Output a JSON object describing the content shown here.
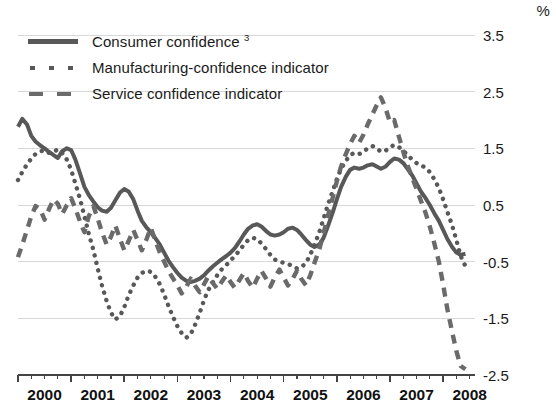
{
  "unit": "%",
  "legend": {
    "position": "top-left-inside",
    "items": [
      {
        "label": "Consumer confidence",
        "footnote": "3",
        "style": "solid",
        "key_name": "legend-key-solid"
      },
      {
        "label": "Manufacturing-confidence indicator",
        "footnote": "",
        "style": "dotted",
        "key_name": "legend-key-dotted"
      },
      {
        "label": "Service confidence indicator",
        "footnote": "",
        "style": "dashed",
        "key_name": "legend-key-dashed"
      }
    ]
  },
  "colors": {
    "consumer": "#585858",
    "manufacturing": "#585858",
    "service": "#6a6a6a",
    "gridline": "#d8d8d8",
    "axis": "#444444",
    "text": "#1a1a1a"
  },
  "chart_data": {
    "type": "line",
    "title": "",
    "subtitle": "",
    "xlabel": "",
    "ylabel": "%",
    "ylim": [
      -2.5,
      3.5
    ],
    "xlim": [
      2000.0,
      2008.6
    ],
    "yticks": [
      3.5,
      2.5,
      1.5,
      0.5,
      -0.5,
      -1.5,
      -2.5
    ],
    "ytick_labels": [
      "3.5",
      "2.5",
      "1.5",
      "0.5",
      "-0.5",
      "-1.5",
      "-2.5"
    ],
    "xticks": [
      2000,
      2001,
      2002,
      2003,
      2004,
      2005,
      2006,
      2007,
      2008
    ],
    "xtick_labels": [
      "2000",
      "2001",
      "2002",
      "2003",
      "2004",
      "2005",
      "2006",
      "2007",
      "2008"
    ],
    "minor_ticks_per_year": 4,
    "grid": true,
    "grid_axis": "y",
    "legend_position": "upper left",
    "series": [
      {
        "name": "Consumer confidence",
        "style": "solid",
        "color": "#585858",
        "x": [
          2000.0,
          2000.08,
          2000.17,
          2000.25,
          2000.33,
          2000.42,
          2000.5,
          2000.58,
          2000.67,
          2000.75,
          2000.83,
          2000.92,
          2001.0,
          2001.08,
          2001.17,
          2001.25,
          2001.33,
          2001.42,
          2001.5,
          2001.58,
          2001.67,
          2001.75,
          2001.83,
          2001.92,
          2002.0,
          2002.08,
          2002.17,
          2002.25,
          2002.33,
          2002.42,
          2002.5,
          2002.58,
          2002.67,
          2002.75,
          2002.83,
          2002.92,
          2003.0,
          2003.08,
          2003.17,
          2003.25,
          2003.33,
          2003.42,
          2003.5,
          2003.58,
          2003.67,
          2003.75,
          2003.83,
          2003.92,
          2004.0,
          2004.08,
          2004.17,
          2004.25,
          2004.33,
          2004.42,
          2004.5,
          2004.58,
          2004.67,
          2004.75,
          2004.83,
          2004.92,
          2005.0,
          2005.08,
          2005.17,
          2005.25,
          2005.33,
          2005.42,
          2005.5,
          2005.58,
          2005.67,
          2005.75,
          2005.83,
          2005.92,
          2006.0,
          2006.08,
          2006.17,
          2006.25,
          2006.33,
          2006.42,
          2006.5,
          2006.58,
          2006.67,
          2006.75,
          2006.83,
          2006.92,
          2007.0,
          2007.08,
          2007.17,
          2007.25,
          2007.33,
          2007.42,
          2007.5,
          2007.58,
          2007.67,
          2007.75,
          2007.83,
          2007.92,
          2008.0,
          2008.08,
          2008.17,
          2008.25,
          2008.33,
          2008.42
        ],
        "y": [
          1.88,
          2.02,
          1.92,
          1.72,
          1.62,
          1.55,
          1.5,
          1.44,
          1.38,
          1.33,
          1.45,
          1.5,
          1.47,
          1.3,
          1.05,
          0.82,
          0.68,
          0.56,
          0.46,
          0.4,
          0.38,
          0.45,
          0.58,
          0.72,
          0.78,
          0.74,
          0.6,
          0.4,
          0.22,
          0.1,
          0.02,
          -0.08,
          -0.2,
          -0.34,
          -0.48,
          -0.6,
          -0.7,
          -0.78,
          -0.84,
          -0.86,
          -0.84,
          -0.8,
          -0.74,
          -0.66,
          -0.58,
          -0.52,
          -0.46,
          -0.4,
          -0.34,
          -0.26,
          -0.14,
          -0.02,
          0.08,
          0.14,
          0.16,
          0.12,
          0.04,
          -0.02,
          -0.04,
          -0.02,
          0.02,
          0.08,
          0.1,
          0.06,
          -0.02,
          -0.12,
          -0.2,
          -0.24,
          -0.2,
          -0.08,
          0.12,
          0.36,
          0.6,
          0.82,
          1.0,
          1.12,
          1.16,
          1.14,
          1.16,
          1.2,
          1.22,
          1.18,
          1.14,
          1.18,
          1.26,
          1.32,
          1.3,
          1.24,
          1.14,
          1.02,
          0.88,
          0.74,
          0.62,
          0.5,
          0.36,
          0.22,
          0.06,
          -0.1,
          -0.24,
          -0.34,
          -0.38,
          -0.36
        ]
      },
      {
        "name": "Manufacturing-confidence indicator",
        "style": "dotted",
        "color": "#585858",
        "x": [
          2000.0,
          2000.08,
          2000.17,
          2000.25,
          2000.33,
          2000.42,
          2000.5,
          2000.58,
          2000.67,
          2000.75,
          2000.83,
          2000.92,
          2001.0,
          2001.08,
          2001.17,
          2001.25,
          2001.33,
          2001.42,
          2001.5,
          2001.58,
          2001.67,
          2001.75,
          2001.83,
          2001.92,
          2002.0,
          2002.08,
          2002.17,
          2002.25,
          2002.33,
          2002.42,
          2002.5,
          2002.58,
          2002.67,
          2002.75,
          2002.83,
          2002.92,
          2003.0,
          2003.08,
          2003.17,
          2003.25,
          2003.33,
          2003.42,
          2003.5,
          2003.58,
          2003.67,
          2003.75,
          2003.83,
          2003.92,
          2004.0,
          2004.08,
          2004.17,
          2004.25,
          2004.33,
          2004.42,
          2004.5,
          2004.58,
          2004.67,
          2004.75,
          2004.83,
          2004.92,
          2005.0,
          2005.08,
          2005.17,
          2005.25,
          2005.33,
          2005.42,
          2005.5,
          2005.58,
          2005.67,
          2005.75,
          2005.83,
          2005.92,
          2006.0,
          2006.08,
          2006.17,
          2006.25,
          2006.33,
          2006.42,
          2006.5,
          2006.58,
          2006.67,
          2006.75,
          2006.83,
          2006.92,
          2007.0,
          2007.08,
          2007.17,
          2007.25,
          2007.33,
          2007.42,
          2007.5,
          2007.58,
          2007.67,
          2007.75,
          2007.83,
          2007.92,
          2008.0,
          2008.08,
          2008.17,
          2008.25,
          2008.33,
          2008.42
        ],
        "y": [
          0.94,
          1.08,
          1.22,
          1.32,
          1.4,
          1.45,
          1.46,
          1.42,
          1.44,
          1.48,
          1.42,
          1.3,
          1.12,
          0.88,
          0.6,
          0.3,
          0.0,
          -0.3,
          -0.62,
          -0.92,
          -1.2,
          -1.4,
          -1.52,
          -1.46,
          -1.3,
          -1.1,
          -0.92,
          -0.78,
          -0.7,
          -0.66,
          -0.68,
          -0.76,
          -0.9,
          -1.08,
          -1.28,
          -1.48,
          -1.64,
          -1.76,
          -1.84,
          -1.78,
          -1.62,
          -1.4,
          -1.18,
          -1.0,
          -0.86,
          -0.74,
          -0.64,
          -0.56,
          -0.48,
          -0.4,
          -0.3,
          -0.2,
          -0.12,
          -0.08,
          -0.1,
          -0.18,
          -0.28,
          -0.38,
          -0.46,
          -0.5,
          -0.52,
          -0.54,
          -0.58,
          -0.62,
          -0.6,
          -0.52,
          -0.38,
          -0.2,
          0.02,
          0.26,
          0.5,
          0.74,
          0.96,
          1.14,
          1.28,
          1.38,
          1.42,
          1.4,
          1.44,
          1.5,
          1.54,
          1.5,
          1.44,
          1.46,
          1.52,
          1.56,
          1.52,
          1.46,
          1.38,
          1.3,
          1.24,
          1.2,
          1.16,
          1.08,
          0.96,
          0.8,
          0.6,
          0.38,
          0.14,
          -0.12,
          -0.4,
          -0.58
        ]
      },
      {
        "name": "Service confidence indicator",
        "style": "dashed",
        "color": "#6a6a6a",
        "x": [
          2000.0,
          2000.08,
          2000.17,
          2000.25,
          2000.33,
          2000.42,
          2000.5,
          2000.58,
          2000.67,
          2000.75,
          2000.83,
          2000.92,
          2001.0,
          2001.08,
          2001.17,
          2001.25,
          2001.33,
          2001.42,
          2001.5,
          2001.58,
          2001.67,
          2001.75,
          2001.83,
          2001.92,
          2002.0,
          2002.08,
          2002.17,
          2002.25,
          2002.33,
          2002.42,
          2002.5,
          2002.58,
          2002.67,
          2002.75,
          2002.83,
          2002.92,
          2003.0,
          2003.08,
          2003.17,
          2003.25,
          2003.33,
          2003.42,
          2003.5,
          2003.58,
          2003.67,
          2003.75,
          2003.83,
          2003.92,
          2004.0,
          2004.08,
          2004.17,
          2004.25,
          2004.33,
          2004.42,
          2004.5,
          2004.58,
          2004.67,
          2004.75,
          2004.83,
          2004.92,
          2005.0,
          2005.08,
          2005.17,
          2005.25,
          2005.33,
          2005.42,
          2005.5,
          2005.58,
          2005.67,
          2005.75,
          2005.83,
          2005.92,
          2006.0,
          2006.08,
          2006.17,
          2006.25,
          2006.33,
          2006.42,
          2006.5,
          2006.58,
          2006.67,
          2006.75,
          2006.83,
          2006.92,
          2007.0,
          2007.08,
          2007.17,
          2007.25,
          2007.33,
          2007.42,
          2007.5,
          2007.58,
          2007.67,
          2007.75,
          2007.83,
          2007.92,
          2008.0,
          2008.08,
          2008.17,
          2008.25,
          2008.33,
          2008.42
        ],
        "y": [
          -0.42,
          -0.2,
          0.06,
          0.3,
          0.48,
          0.42,
          0.24,
          0.42,
          0.6,
          0.52,
          0.34,
          0.5,
          0.62,
          0.44,
          0.2,
          0.02,
          0.3,
          0.48,
          0.26,
          0.02,
          -0.2,
          -0.06,
          0.14,
          -0.1,
          -0.3,
          -0.14,
          0.06,
          -0.12,
          -0.3,
          -0.1,
          0.1,
          -0.12,
          -0.34,
          -0.5,
          -0.66,
          -0.8,
          -0.92,
          -1.06,
          -0.94,
          -0.8,
          -0.92,
          -1.04,
          -0.9,
          -0.76,
          -0.88,
          -0.98,
          -0.86,
          -0.74,
          -0.86,
          -0.96,
          -0.82,
          -0.7,
          -0.84,
          -0.96,
          -0.8,
          -0.66,
          -0.8,
          -0.94,
          -0.78,
          -0.64,
          -0.78,
          -0.92,
          -0.8,
          -0.66,
          -0.8,
          -0.92,
          -0.74,
          -0.52,
          -0.28,
          0.0,
          0.3,
          0.62,
          0.92,
          1.18,
          1.4,
          1.58,
          1.72,
          1.6,
          1.74,
          1.92,
          2.1,
          2.26,
          2.4,
          2.2,
          1.96,
          2.0,
          1.7,
          1.44,
          1.2,
          0.98,
          0.78,
          0.58,
          0.36,
          0.12,
          -0.16,
          -0.5,
          -0.9,
          -1.34,
          -1.74,
          -2.08,
          -2.34,
          -2.4
        ]
      }
    ]
  }
}
